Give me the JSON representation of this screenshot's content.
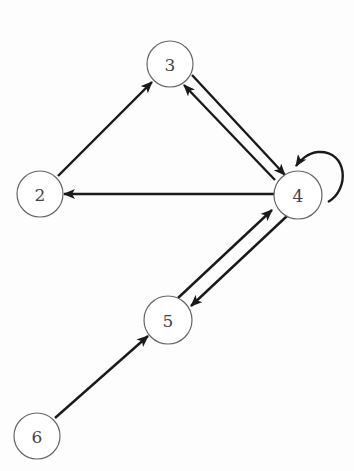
{
  "diagram": {
    "type": "directed-graph",
    "nodes": [
      {
        "id": "2",
        "label": "2",
        "x": 40,
        "y": 194
      },
      {
        "id": "3",
        "label": "3",
        "x": 170,
        "y": 64
      },
      {
        "id": "4",
        "label": "4",
        "x": 298,
        "y": 195
      },
      {
        "id": "5",
        "label": "5",
        "x": 168,
        "y": 320
      },
      {
        "id": "6",
        "label": "6",
        "x": 37,
        "y": 436
      }
    ],
    "edges": [
      {
        "from": "2",
        "to": "3"
      },
      {
        "from": "3",
        "to": "4"
      },
      {
        "from": "4",
        "to": "3"
      },
      {
        "from": "4",
        "to": "2"
      },
      {
        "from": "4",
        "to": "4"
      },
      {
        "from": "4",
        "to": "5"
      },
      {
        "from": "5",
        "to": "4"
      },
      {
        "from": "6",
        "to": "5"
      }
    ]
  }
}
